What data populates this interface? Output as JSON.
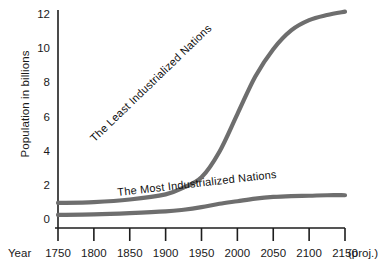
{
  "chart_data": {
    "type": "line",
    "title": "",
    "xlabel": "Year",
    "ylabel": "Population in billions",
    "xlim": [
      1750,
      2150
    ],
    "ylim": [
      0,
      12
    ],
    "grid": false,
    "legend_position": "inline-curve-labels",
    "x_tick_labels": [
      "1750",
      "1800",
      "1850",
      "1900",
      "1950",
      "2000",
      "2050",
      "2100",
      "2150"
    ],
    "x_tick_values": [
      1750,
      1800,
      1850,
      1900,
      1950,
      2000,
      2050,
      2100,
      2150
    ],
    "x_axis_note": "(proj.)",
    "y_tick_labels": [
      "0",
      "2",
      "4",
      "6",
      "8",
      "10",
      "12"
    ],
    "y_tick_values": [
      0,
      2,
      4,
      6,
      8,
      10,
      12
    ],
    "series": [
      {
        "name": "The Least Industrialized Nations",
        "color": "#6e6e6e",
        "x": [
          1750,
          1800,
          1850,
          1900,
          1925,
          1950,
          1975,
          2000,
          2025,
          2050,
          2075,
          2100,
          2125,
          2150
        ],
        "values": [
          1.0,
          1.05,
          1.2,
          1.5,
          1.9,
          2.5,
          4.0,
          6.2,
          8.4,
          10.0,
          11.1,
          11.7,
          12.0,
          12.2
        ]
      },
      {
        "name": "The Most Industrialized Nations",
        "color": "#6e6e6e",
        "x": [
          1750,
          1800,
          1850,
          1900,
          1925,
          1950,
          1975,
          2000,
          2025,
          2050,
          2075,
          2100,
          2125,
          2150
        ],
        "values": [
          0.3,
          0.33,
          0.4,
          0.5,
          0.6,
          0.75,
          0.95,
          1.1,
          1.25,
          1.35,
          1.4,
          1.42,
          1.45,
          1.45
        ]
      }
    ],
    "annotations": [
      {
        "text": "The Least Industrialized Nations",
        "rotation_deg": -44
      },
      {
        "text": "The Most Industrialized Nations",
        "rotation_deg": -6.5
      }
    ]
  },
  "axis": {
    "y_title": "Population in billions",
    "x_title": "Year",
    "x_note": "(proj.)"
  }
}
